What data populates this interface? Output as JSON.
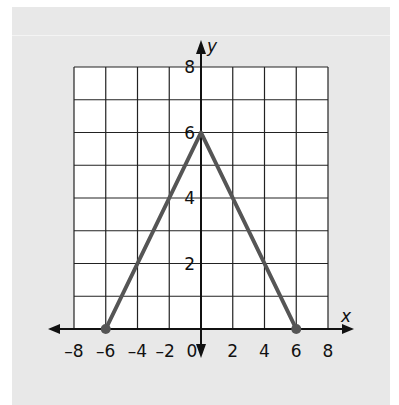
{
  "chart_data": {
    "type": "line",
    "title": "",
    "xlabel": "x",
    "ylabel": "y",
    "xlim": [
      -8,
      8
    ],
    "ylim": [
      0,
      8
    ],
    "grid": true,
    "grid_step": {
      "x": 2,
      "y": 1
    },
    "x_ticks": [
      "-8",
      "-6",
      "-4",
      "-2",
      "0",
      "2",
      "4",
      "6",
      "8"
    ],
    "y_ticks": [
      "2",
      "4",
      "6",
      "8"
    ],
    "series": [
      {
        "name": "triangle-graph",
        "x": [
          -6,
          0,
          6
        ],
        "y": [
          0,
          6,
          0
        ],
        "color": "#555555",
        "endpoints": [
          [
            -6,
            0
          ],
          [
            6,
            0
          ]
        ]
      }
    ]
  },
  "colors": {
    "panel": "#e8e8e8",
    "grid": "#222222",
    "plot_bg": "#ffffff",
    "line": "#555555",
    "axis": "#111111"
  }
}
